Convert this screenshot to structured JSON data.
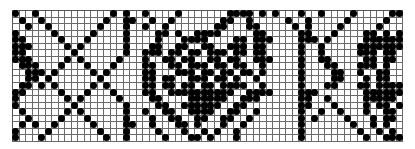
{
  "chart": {
    "type": "knitting-colorwork-chart",
    "columns": 60,
    "rows": 20,
    "colors": {
      "dot": "#000000",
      "background": "#ffffff",
      "grid": "#6a6a6a"
    },
    "pattern": [
      "100100000000000101001000010000000111101010001001000010000011",
      "010010000000001001100100100000001100100000100100000100000100",
      "001001000000010001001001000000011000110000010100001000001000",
      "100000100000100001000011010011110000011000001100010000110101",
      "110000010001000001000010001111000011011100001110100000111111",
      "111000001010000001000110011001100111011000001001000001111111",
      "110000000100000001001110110110111011011000001001000001110110",
      "111000001010000010001001101100110110011100001001100000110110",
      "011100010001000100001100110111011011001000001000110001110100",
      "001110100000101000001100011101101101101000001000011001001100",
      "001101000000010000001101100111011010010000001000011000101100",
      "011010100000101000001101101101101111001000001000110001101111",
      "110000010001000100001100111111111100111100001110000000111111",
      "100000001010000010000110000111111001110000001100100000111110",
      "100000000100000001000011001111110011000000001100010000101101",
      "010000001010000001001001100111100110010000001001001000100110",
      "001000010001000001000100110011001100100000001010000100010110",
      "010100100000100001100100011010001001000000001000000010010100",
      "100001000000010001000010001001010010000000001000000001001010",
      "100010000000001001000001000110100010000000001000000000100111"
    ]
  }
}
